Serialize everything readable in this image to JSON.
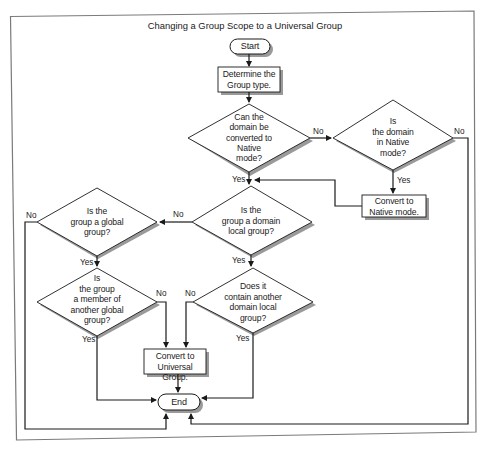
{
  "title": "Changing a Group Scope to a Universal Group",
  "nodes": {
    "start": {
      "type": "terminator",
      "label": "Start"
    },
    "determine": {
      "type": "process",
      "label_lines": [
        "Determine the",
        "Group type."
      ]
    },
    "can_convert": {
      "type": "decision",
      "label_lines": [
        "Can the",
        "domain be",
        "converted to",
        "Native",
        "mode?"
      ]
    },
    "in_native": {
      "type": "decision",
      "label_lines": [
        "Is",
        "the domain",
        "in Native",
        "mode?"
      ]
    },
    "convert_native": {
      "type": "process",
      "label_lines": [
        "Convert to",
        "Native mode."
      ]
    },
    "domain_local": {
      "type": "decision",
      "label_lines": [
        "Is the",
        "group a domain",
        "local group?"
      ]
    },
    "global_group": {
      "type": "decision",
      "label_lines": [
        "Is the",
        "group a global",
        "group?"
      ]
    },
    "member_global": {
      "type": "decision",
      "label_lines": [
        "Is",
        "the group",
        "a member of",
        "another global",
        "group?"
      ]
    },
    "contain_local": {
      "type": "decision",
      "label_lines": [
        "Does it",
        "contain another",
        "domain local",
        "group?"
      ]
    },
    "convert_universal": {
      "type": "process",
      "label_lines": [
        "Convert to",
        "Universal Group."
      ]
    },
    "end": {
      "type": "terminator",
      "label": "End"
    }
  },
  "edge_labels": {
    "can_convert_no": "No",
    "can_convert_yes": "Yes",
    "in_native_no": "No",
    "in_native_yes": "Yes",
    "domain_local_no": "No",
    "domain_local_yes": "Yes",
    "global_group_no": "No",
    "global_group_yes": "Yes",
    "member_global_no": "No",
    "member_global_yes": "Yes",
    "contain_local_no": "No",
    "contain_local_yes": "Yes"
  },
  "colors": {
    "line": "#1a1a1a",
    "shadow": "#9a9a9a",
    "frame": "#8a8a8a",
    "fill": "#ffffff"
  }
}
